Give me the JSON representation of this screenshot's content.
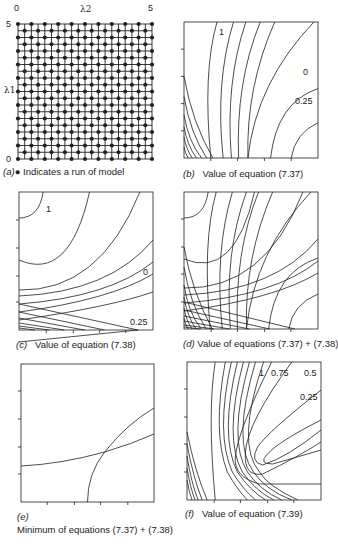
{
  "figure": {
    "panels": [
      {
        "id": "a",
        "caption_letter": "(a)",
        "caption_text": "● Indicates a run of model",
        "axis": {
          "x_label": "λ2",
          "y_label": "λ1",
          "x_min_label": "0",
          "x_max_label": "5",
          "y_min_label": "0",
          "y_max_label": "5"
        }
      },
      {
        "id": "b",
        "caption_letter": "(b)",
        "caption_text": "Value of equation (7.37)",
        "contour_labels": [
          "1",
          "0",
          "0.25"
        ]
      },
      {
        "id": "c",
        "caption_letter": "(c)",
        "caption_text": "Value of equation (7.38)",
        "contour_labels": [
          "1",
          "0",
          "0.25"
        ]
      },
      {
        "id": "d",
        "caption_letter": "(d)",
        "caption_text": "Value of equations (7.37) + (7.38)"
      },
      {
        "id": "e",
        "caption_letter": "(e)",
        "caption_text": "Minimum of equations (7.37) + (7.38)"
      },
      {
        "id": "f",
        "caption_letter": "(f)",
        "caption_text": "Value of equation (7.39)",
        "contour_labels": [
          "1",
          "0.75",
          "0.5",
          "0.25"
        ]
      }
    ]
  },
  "colors": {
    "ink": "#222222",
    "background": "#ffffff"
  }
}
